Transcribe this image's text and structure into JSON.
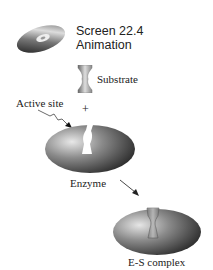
{
  "header": {
    "screen_label": "Screen 22.4",
    "animation_label": "Animation",
    "icon": "cd-disc-icon"
  },
  "diagram": {
    "substrate_label": "Substrate",
    "active_site_label": "Active site",
    "plus_sign": "+",
    "enzyme_label": "Enzyme",
    "complex_label": "E-S complex",
    "colors": {
      "enzyme_dark": "#3a3a3a",
      "enzyme_light": "#e8e8e8",
      "substrate": "#9a9a9a"
    }
  }
}
